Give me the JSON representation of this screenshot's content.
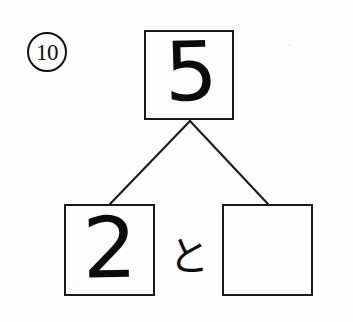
{
  "worksheet": {
    "page_background": "#fdfdfd",
    "ink_color": "#111111",
    "question_number": "10",
    "question_number_style": "circled",
    "exercise_type": "number-bond-decomposition"
  },
  "diagram": {
    "whole": {
      "label": "whole-box",
      "value": "5",
      "filled": true
    },
    "parts": [
      {
        "label": "part-box-left",
        "value": "2",
        "filled": true
      },
      {
        "label": "part-box-right",
        "value": "",
        "filled": false
      }
    ],
    "conjunction": "と",
    "connectors": [
      {
        "name": "branch-left",
        "from_x": 190,
        "from_y": 121,
        "to_x": 110,
        "to_y": 204
      },
      {
        "name": "branch-right",
        "from_x": 190,
        "from_y": 121,
        "to_x": 268,
        "to_y": 204
      }
    ]
  }
}
